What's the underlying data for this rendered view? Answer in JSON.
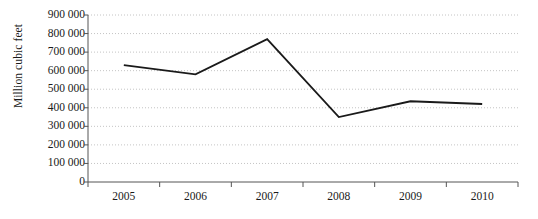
{
  "chart_data": {
    "type": "line",
    "title": "",
    "xlabel": "",
    "ylabel": "Million cubic feet",
    "categories": [
      "2005",
      "2006",
      "2007",
      "2008",
      "2009",
      "2010"
    ],
    "values": [
      630000,
      580000,
      770000,
      350000,
      435000,
      420000
    ],
    "series": [
      {
        "name": "Million cubic feet",
        "values": [
          630000,
          580000,
          770000,
          350000,
          435000,
          420000
        ]
      }
    ],
    "ylim": [
      0,
      900000
    ],
    "ytick_values": [
      0,
      100000,
      200000,
      300000,
      400000,
      500000,
      600000,
      700000,
      800000,
      900000
    ],
    "ytick_labels": [
      "0",
      "100 000",
      "200 000",
      "300 000",
      "400 000",
      "500 000",
      "600 000",
      "700 000",
      "800 000",
      "900 000"
    ],
    "grid": "horizontal-dotted",
    "legend": "none",
    "line_color": "#1a1a1a",
    "grid_color": "#b5b5b5",
    "axis_color": "#555555",
    "background_color": "#ffffff"
  }
}
